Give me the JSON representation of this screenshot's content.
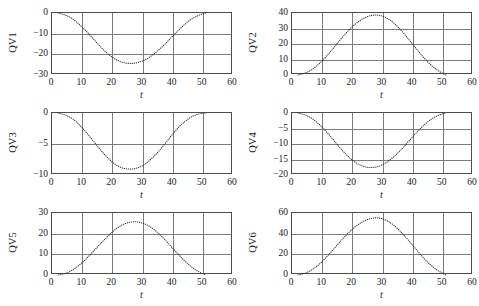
{
  "figure": {
    "width": 479,
    "height": 306,
    "background": "#ffffff",
    "layout": "2 columns x 3 rows of line subplots",
    "grid": true,
    "line_style": "dotted",
    "line_color": "#2b2b2b",
    "frame_color": "#4d4d4d",
    "gridline_color": "#7a7a7a"
  },
  "chart_data": [
    {
      "type": "line",
      "title": "",
      "xlabel": "t",
      "ylabel": "QV1",
      "xlim": [
        0,
        60
      ],
      "ylim": [
        -30,
        0
      ],
      "xticks": [
        "0",
        "10",
        "20",
        "30",
        "40",
        "50",
        "60"
      ],
      "yticks": [
        "0",
        "−10",
        "−20",
        "−30"
      ],
      "grid": true,
      "x": [
        2,
        4,
        6,
        8,
        10,
        12,
        14,
        16,
        18,
        20,
        22,
        24,
        26,
        28,
        30,
        32,
        34,
        36,
        38,
        40,
        42,
        44,
        46,
        48,
        50,
        51
      ],
      "y": [
        0,
        -0.8,
        -2.1,
        -4.2,
        -6.8,
        -9.8,
        -13.0,
        -16.2,
        -19.1,
        -21.4,
        -23.1,
        -24.1,
        -24.4,
        -24.1,
        -23.2,
        -21.7,
        -19.6,
        -17.0,
        -14.2,
        -11.2,
        -8.2,
        -5.5,
        -3.2,
        -1.5,
        -0.4,
        0
      ]
    },
    {
      "type": "line",
      "title": "",
      "xlabel": "t",
      "ylabel": "QV2",
      "xlim": [
        0,
        60
      ],
      "ylim": [
        0,
        40
      ],
      "xticks": [
        "0",
        "10",
        "20",
        "30",
        "40",
        "50",
        "60"
      ],
      "yticks": [
        "0",
        "10",
        "20",
        "30",
        "40"
      ],
      "grid": true,
      "x": [
        2,
        4,
        6,
        8,
        10,
        12,
        14,
        16,
        18,
        20,
        22,
        24,
        26,
        28,
        30,
        32,
        34,
        36,
        38,
        40,
        42,
        44,
        46,
        48,
        50,
        51
      ],
      "y": [
        0,
        1.0,
        2.8,
        5.6,
        9.2,
        13.4,
        18.0,
        22.7,
        27.2,
        31.2,
        34.4,
        36.8,
        38.3,
        38.7,
        38.0,
        36.1,
        33.1,
        29.2,
        24.7,
        19.9,
        15.1,
        10.6,
        6.6,
        3.4,
        1.0,
        0
      ]
    },
    {
      "type": "line",
      "title": "",
      "xlabel": "t",
      "ylabel": "QV3",
      "xlim": [
        0,
        60
      ],
      "ylim": [
        -10,
        0
      ],
      "xticks": [
        "0",
        "10",
        "20",
        "30",
        "40",
        "50",
        "60"
      ],
      "yticks": [
        "0",
        "−5",
        "−10"
      ],
      "grid": true,
      "x": [
        2,
        4,
        6,
        8,
        10,
        12,
        14,
        16,
        18,
        20,
        22,
        24,
        26,
        28,
        30,
        32,
        34,
        36,
        38,
        40,
        42,
        44,
        46,
        48,
        50,
        51
      ],
      "y": [
        0,
        -0.25,
        -0.7,
        -1.4,
        -2.4,
        -3.5,
        -4.7,
        -5.9,
        -7.0,
        -7.9,
        -8.6,
        -8.95,
        -9.05,
        -8.9,
        -8.5,
        -7.8,
        -6.9,
        -5.8,
        -4.6,
        -3.4,
        -2.3,
        -1.4,
        -0.7,
        -0.25,
        -0.05,
        0
      ]
    },
    {
      "type": "line",
      "title": "",
      "xlabel": "t",
      "ylabel": "QV4",
      "xlim": [
        0,
        60
      ],
      "ylim": [
        -20,
        0
      ],
      "xticks": [
        "0",
        "10",
        "20",
        "30",
        "40",
        "50",
        "60"
      ],
      "yticks": [
        "0",
        "−5",
        "−10",
        "−15",
        "−20"
      ],
      "grid": true,
      "x": [
        2,
        4,
        6,
        8,
        10,
        12,
        14,
        16,
        18,
        20,
        22,
        24,
        26,
        28,
        30,
        32,
        34,
        36,
        38,
        40,
        42,
        44,
        46,
        48,
        50,
        51
      ],
      "y": [
        0,
        -0.5,
        -1.4,
        -2.8,
        -4.6,
        -6.7,
        -9.0,
        -11.3,
        -13.4,
        -15.2,
        -16.5,
        -17.3,
        -17.6,
        -17.4,
        -16.7,
        -15.5,
        -13.9,
        -12.0,
        -9.9,
        -7.7,
        -5.6,
        -3.7,
        -2.1,
        -1.0,
        -0.25,
        0
      ]
    },
    {
      "type": "line",
      "title": "",
      "xlabel": "t",
      "ylabel": "QV5",
      "xlim": [
        0,
        60
      ],
      "ylim": [
        0,
        30
      ],
      "xticks": [
        "0",
        "10",
        "20",
        "30",
        "40",
        "50",
        "60"
      ],
      "yticks": [
        "0",
        "10",
        "20",
        "30"
      ],
      "grid": true,
      "x": [
        2,
        4,
        6,
        8,
        10,
        12,
        14,
        16,
        18,
        20,
        22,
        24,
        26,
        28,
        30,
        32,
        34,
        36,
        38,
        40,
        42,
        44,
        46,
        48,
        50,
        51
      ],
      "y": [
        0,
        0.6,
        1.8,
        3.6,
        6.0,
        8.8,
        11.9,
        15.0,
        18.0,
        20.8,
        23.1,
        24.7,
        25.6,
        25.7,
        25.1,
        23.8,
        21.8,
        19.2,
        16.2,
        13.0,
        9.8,
        6.8,
        4.2,
        2.1,
        0.6,
        0
      ]
    },
    {
      "type": "line",
      "title": "",
      "xlabel": "t",
      "ylabel": "QV6",
      "xlim": [
        0,
        60
      ],
      "ylim": [
        0,
        60
      ],
      "xticks": [
        "0",
        "10",
        "20",
        "30",
        "40",
        "50",
        "60"
      ],
      "yticks": [
        "0",
        "20",
        "40",
        "60"
      ],
      "grid": true,
      "x": [
        2,
        4,
        6,
        8,
        10,
        12,
        14,
        16,
        18,
        20,
        22,
        24,
        26,
        28,
        30,
        32,
        34,
        36,
        38,
        40,
        42,
        44,
        46,
        48,
        50,
        51
      ],
      "y": [
        0,
        1.4,
        4.0,
        8.0,
        13.1,
        19.2,
        25.8,
        32.4,
        38.7,
        44.3,
        48.9,
        52.4,
        54.6,
        55.3,
        54.4,
        51.7,
        47.5,
        42.0,
        35.6,
        28.8,
        21.9,
        15.3,
        9.6,
        5.0,
        1.5,
        0
      ]
    }
  ]
}
